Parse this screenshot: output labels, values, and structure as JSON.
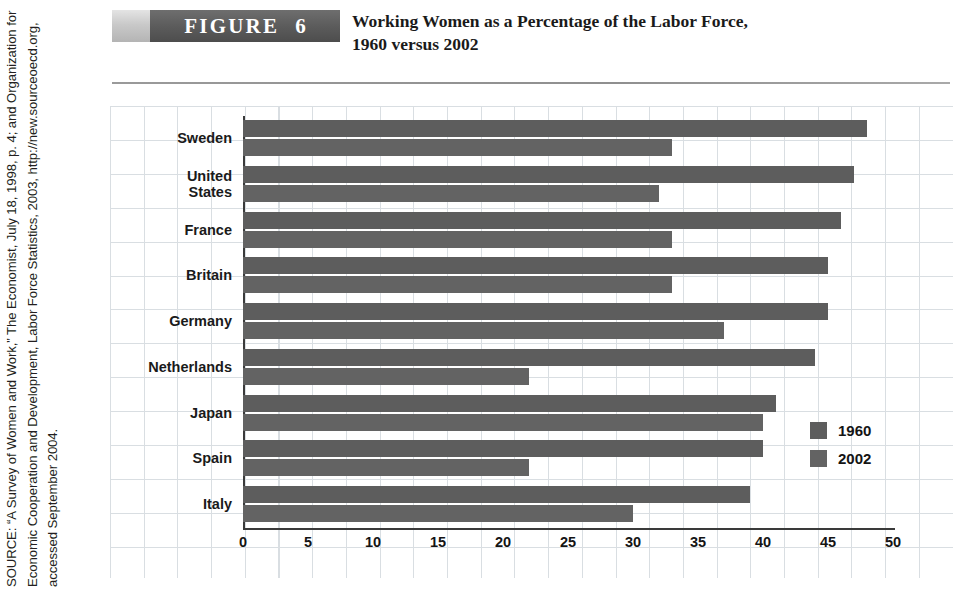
{
  "source": {
    "label": "SOURCE:",
    "text": "SOURCE: “A Survey of Women and Work,” The Economist, July 18, 1998, p. 4; and Organization for Economic Cooperation and Development, Labor Force Statistics, 2003, http://new.sourceoecd.org, accessed September 2004."
  },
  "header": {
    "figure_word": "FIGURE",
    "figure_number": "6",
    "title_line1": "Working Women as a Percentage of the Labor Force,",
    "title_line2": "1960 versus 2002"
  },
  "colors": {
    "banner": "#5c5c5c",
    "bar_1960": "#5d5d5d",
    "bar_2002": "#636363",
    "grid": "#d9dee2",
    "axis": "#3a3a3a"
  },
  "chart_data": {
    "type": "bar",
    "orientation": "horizontal",
    "title": "Working Women as a Percentage of the Labor Force, 1960 versus 2002",
    "xlabel": "",
    "ylabel": "",
    "xlim": [
      0,
      50
    ],
    "xticks": [
      0,
      5,
      10,
      15,
      20,
      25,
      30,
      35,
      40,
      45,
      50
    ],
    "grid": true,
    "legend_position": "inside-right",
    "categories": [
      "Sweden",
      "United States",
      "France",
      "Britain",
      "Germany",
      "Netherlands",
      "Japan",
      "Spain",
      "Italy"
    ],
    "series": [
      {
        "name": "1960",
        "values": [
          33,
          32,
          33,
          33,
          37,
          22,
          40,
          22,
          30
        ]
      },
      {
        "name": "2002",
        "values": [
          48,
          47,
          46,
          45,
          45,
          44,
          41,
          40,
          39
        ]
      }
    ]
  }
}
